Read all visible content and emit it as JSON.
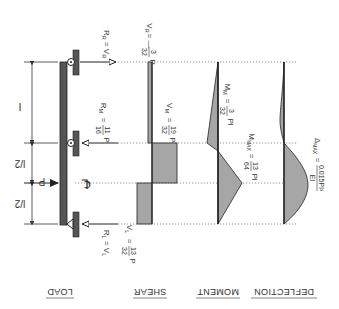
{
  "diagram": {
    "orientation": "rotated-180",
    "colors": {
      "beam": "#555555",
      "fill": "#a6a6a6",
      "line": "#222222",
      "text": "#333333",
      "dotted": "#666666"
    },
    "panels": {
      "load": "LOAD",
      "shear": "SHEAR",
      "moment": "MOMENT",
      "deflection": "DEFLECTION"
    },
    "dimensions": {
      "half_span_1": "l/2",
      "half_span_2": "l/2",
      "overhang": "l"
    },
    "load": {
      "label": "P",
      "centerline": "℄"
    },
    "reactions": {
      "left": {
        "name": "R",
        "sub": "L",
        "eq": "= V",
        "eq_sub": "L"
      },
      "middle": {
        "name": "R",
        "sub": "M",
        "eq": "=",
        "num": "11",
        "den": "16",
        "unit": "P"
      },
      "right": {
        "name": "R",
        "sub": "R",
        "eq": "= V",
        "eq_sub": "R"
      }
    },
    "shear": {
      "left": {
        "name": "V",
        "sub": "L",
        "eq": "=",
        "num": "13",
        "den": "32",
        "unit": "P"
      },
      "middle": {
        "name": "V",
        "sub": "M",
        "eq": "=",
        "num": "19",
        "den": "32",
        "unit": "P"
      },
      "right": {
        "name": "V",
        "sub": "R",
        "eq": "= —",
        "num": "3",
        "den": "32",
        "unit": "P"
      }
    },
    "moment": {
      "max": {
        "name": "M",
        "sub": "MAX",
        "eq": "=",
        "num": "13",
        "den": "64",
        "unit": "Pl"
      },
      "middle": {
        "name": "M",
        "sub": "M",
        "eq": "=",
        "num": "3",
        "den": "32",
        "unit": "Pl"
      }
    },
    "deflection": {
      "max": {
        "name": "Δ",
        "sub": "MAX",
        "eq": "=",
        "num": "0.015Pl³",
        "den": "EI"
      }
    }
  }
}
